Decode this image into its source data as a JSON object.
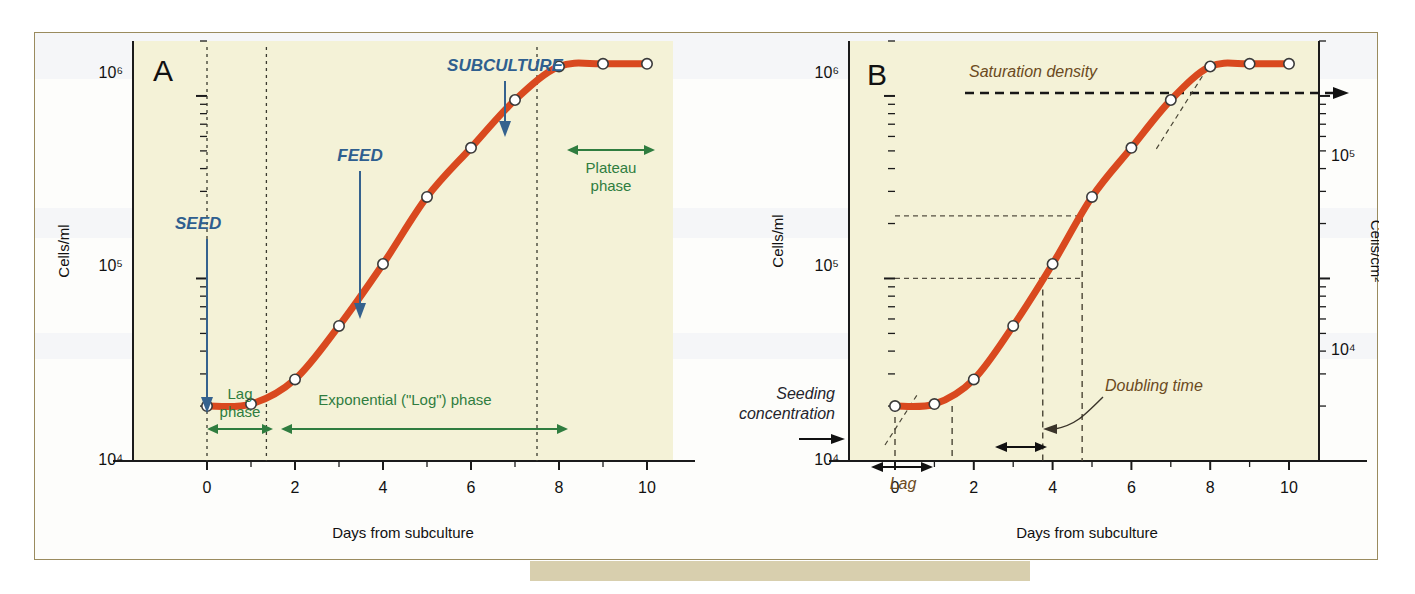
{
  "figure": {
    "background_color": "#f4f2d7",
    "curve_color": "#d9491f",
    "border_color": "#9a8b5e"
  },
  "panels": [
    {
      "id": "A",
      "letter": "A",
      "xlabel": "Days from subculture",
      "ylabel": "Cells/ml",
      "xticks": [
        "0",
        "2",
        "4",
        "6",
        "8",
        "10"
      ],
      "yticks": [
        "10⁴",
        "10⁵",
        "10⁶"
      ],
      "annotations": {
        "seed": "SEED",
        "feed": "FEED",
        "subculture": "SUBCULTURE",
        "lag_phase_line1": "Lag",
        "lag_phase_line2": "phase",
        "exponential_phase": "Exponential (\"Log\") phase",
        "plateau_line1": "Plateau",
        "plateau_line2": "phase"
      }
    },
    {
      "id": "B",
      "letter": "B",
      "xlabel": "Days from subculture",
      "ylabel_left": "Cells/ml",
      "ylabel_right": "Cells/cm²",
      "xticks": [
        "0",
        "2",
        "4",
        "6",
        "8",
        "10"
      ],
      "yticks_left": [
        "10⁴",
        "10⁵",
        "10⁶"
      ],
      "yticks_right": [
        "10⁴",
        "10⁵"
      ],
      "annotations": {
        "saturation_density": "Saturation density",
        "seeding_concentration_line1": "Seeding",
        "seeding_concentration_line2": "concentration",
        "lag": "Lag",
        "doubling_time": "Doubling time"
      }
    }
  ],
  "chart_data": [
    {
      "type": "line",
      "panel": "A",
      "title": "",
      "xlabel": "Days from subculture",
      "ylabel": "Cells/ml",
      "xlim": [
        -0.8,
        11.0
      ],
      "ylim": [
        10000,
        2000000
      ],
      "yscale": "log",
      "grid": false,
      "legend": "none",
      "x": [
        0,
        1,
        2,
        3,
        4,
        5,
        6,
        7,
        8,
        9,
        10
      ],
      "values": [
        20000,
        20500,
        28000,
        55000,
        120000,
        280000,
        520000,
        950000,
        1450000,
        1500000,
        1500000
      ],
      "markers": "open-circle",
      "annotations": [
        {
          "label": "SEED",
          "x": 0,
          "kind": "arrow-down",
          "color": "#2f5f8f"
        },
        {
          "label": "FEED",
          "x": 4,
          "kind": "arrow-down",
          "color": "#2f5f8f"
        },
        {
          "label": "SUBCULTURE",
          "x": 7,
          "kind": "arrow-down",
          "color": "#2f5f8f"
        },
        {
          "label": "Lag phase",
          "x_start": 0,
          "x_end": 1.35,
          "kind": "span",
          "color": "#2f7d3f"
        },
        {
          "label": "Exponential (\"Log\") phase",
          "x_start": 1.35,
          "x_end": 7.5,
          "kind": "span",
          "color": "#2f7d3f"
        },
        {
          "label": "Plateau phase",
          "x_start": 7.9,
          "x_end": 10.2,
          "kind": "span",
          "color": "#2f7d3f"
        }
      ],
      "vertical_dashed_at": [
        0,
        1.35,
        7.5
      ]
    },
    {
      "type": "line",
      "panel": "B",
      "title": "",
      "xlabel": "Days from subculture",
      "ylabel": "Cells/ml",
      "ylabel_secondary": "Cells/cm²",
      "xlim": [
        -0.8,
        11.0
      ],
      "ylim": [
        10000,
        2000000
      ],
      "yscale": "log",
      "grid": false,
      "legend": "none",
      "x": [
        0,
        1,
        2,
        3,
        4,
        5,
        6,
        7,
        8,
        9,
        10
      ],
      "values": [
        20000,
        20500,
        28000,
        55000,
        120000,
        280000,
        520000,
        950000,
        1450000,
        1500000,
        1500000
      ],
      "markers": "open-circle",
      "reference_lines": [
        {
          "kind": "horizontal",
          "value": 100000,
          "style": "dashed",
          "label": ""
        },
        {
          "kind": "horizontal",
          "value": 220000,
          "style": "dashed",
          "label": ""
        },
        {
          "kind": "horizontal",
          "value": 1500000,
          "style": "dashed-bold",
          "label": "Saturation density"
        },
        {
          "kind": "horizontal",
          "value": 20000,
          "style": "dashed",
          "label": "Seeding concentration"
        },
        {
          "kind": "vertical",
          "value": 3.75,
          "style": "dashed",
          "label": ""
        },
        {
          "kind": "vertical",
          "value": 4.75,
          "style": "dashed",
          "label": ""
        },
        {
          "kind": "vertical",
          "value": 0,
          "style": "dashed",
          "label": ""
        },
        {
          "kind": "vertical",
          "value": 1.45,
          "style": "dashed",
          "label": ""
        }
      ],
      "annotations": [
        {
          "label": "Lag",
          "x_start": 0,
          "x_end": 1.45,
          "kind": "span",
          "color": "#6b4a21"
        },
        {
          "label": "Doubling time",
          "x_start": 3.75,
          "x_end": 4.75,
          "kind": "span",
          "color": "#111111"
        },
        {
          "label": "Saturation density",
          "kind": "text",
          "color": "#3a2e14"
        },
        {
          "label": "Seeding concentration",
          "kind": "text",
          "color": "#24242c"
        }
      ]
    }
  ]
}
